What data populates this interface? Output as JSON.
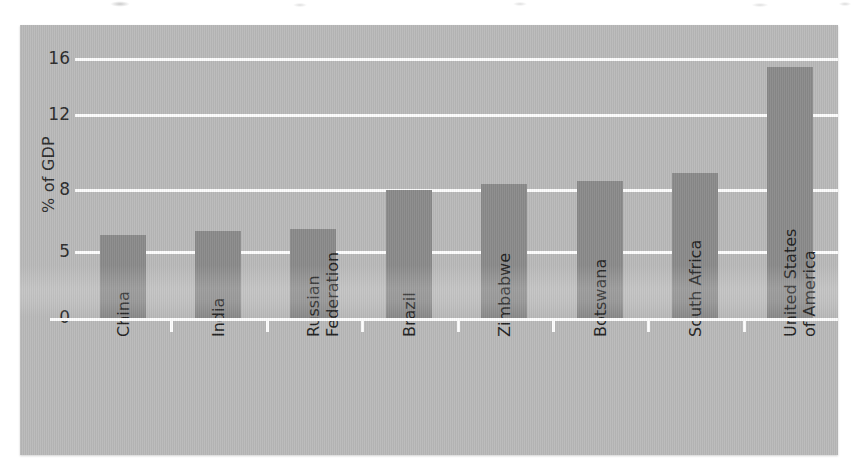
{
  "chart_data": {
    "type": "bar",
    "title": "",
    "subtitle": "",
    "xlabel": "",
    "ylabel": "% of GDP",
    "categories": [
      "China",
      "India",
      "Russian\nFederation",
      "Brazil",
      "Zimbabwe",
      "Botswana",
      "South Africa",
      "United States\nof America"
    ],
    "values": [
      5.8,
      6.0,
      6.1,
      8.0,
      8.3,
      8.5,
      8.9,
      15.4
    ],
    "ytick_labels": [
      "0",
      "5",
      "8",
      "12",
      "16"
    ],
    "ytick_values": [
      0,
      5,
      8,
      12,
      16
    ],
    "ylim": [
      0,
      17.5
    ],
    "grid": "horizontal-white",
    "legend": "none",
    "orientation": "vertical",
    "bar_color": "#8a8a8a",
    "panel_color": "#b9b9b9",
    "gridline_color": "#fdfdfd",
    "text_color": "#1f1f1f"
  },
  "axes": {
    "y_title": "% of GDP",
    "ticks": [
      {
        "label": "16",
        "value": 16
      },
      {
        "label": "12",
        "value": 12
      },
      {
        "label": "8",
        "value": 8
      },
      {
        "label": "5",
        "value": 5
      },
      {
        "label": "0",
        "value": 0
      }
    ]
  },
  "bars": [
    {
      "label": "China",
      "value": 5.8
    },
    {
      "label": "India",
      "value": 6.0
    },
    {
      "label": "Russian\nFederation",
      "value": 6.1
    },
    {
      "label": "Brazil",
      "value": 8.0
    },
    {
      "label": "Zimbabwe",
      "value": 8.3
    },
    {
      "label": "Botswana",
      "value": 8.5
    },
    {
      "label": "South Africa",
      "value": 8.9
    },
    {
      "label": "United States\nof America",
      "value": 15.4
    }
  ]
}
